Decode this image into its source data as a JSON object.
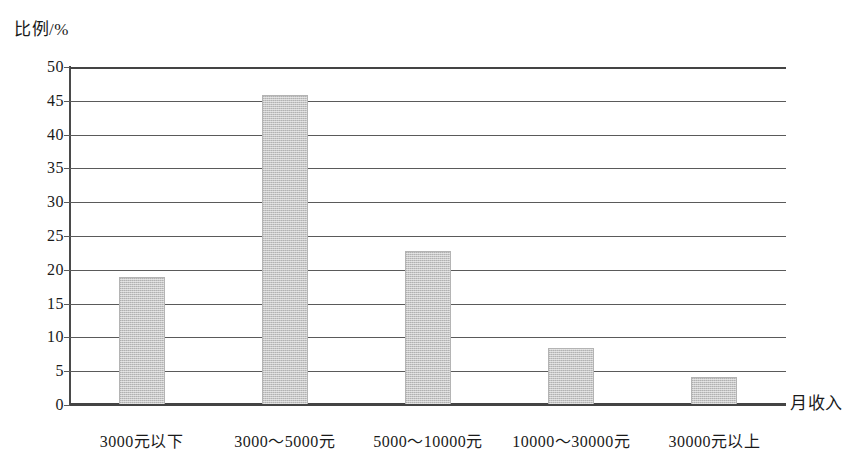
{
  "chart_data": {
    "type": "bar",
    "title": "",
    "xlabel": "月收入",
    "ylabel": "比例/%",
    "categories": [
      "3000元以下",
      "3000～5000元",
      "5000～10000元",
      "10000～30000元",
      "30000元以上"
    ],
    "values": [
      19.0,
      45.8,
      22.8,
      8.5,
      4.2
    ],
    "ylim": [
      0,
      50
    ],
    "ytick_step": 5,
    "yticks": [
      "50",
      "45",
      "40",
      "35",
      "30",
      "25",
      "20",
      "15",
      "10",
      "5",
      "0"
    ],
    "grid": true,
    "legend": "none",
    "bar_color": "#c6c6c6",
    "axis_color": "#444444"
  }
}
